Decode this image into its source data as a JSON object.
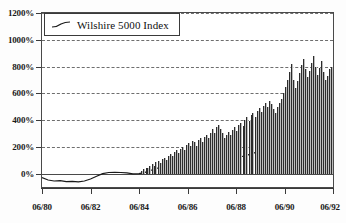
{
  "chart_data": {
    "type": "bar",
    "title": "",
    "xlabel": "",
    "ylabel": "",
    "ylim": [
      -100,
      1200
    ],
    "xlim": [
      "06/80",
      "06/92"
    ],
    "grid": true,
    "legend_position": "top-left",
    "y_ticks": [
      "0%",
      "200%",
      "400%",
      "600%",
      "800%",
      "1000%",
      "1200%"
    ],
    "y_tick_values": [
      0,
      200,
      400,
      600,
      800,
      1000,
      1200
    ],
    "x_ticks": [
      "06/80",
      "06/82",
      "06/84",
      "06/86",
      "06/88",
      "06/90",
      "06/92"
    ],
    "x_tick_values": [
      1980.5,
      1982.5,
      1984.5,
      1986.5,
      1988.5,
      1990.5,
      1992.5
    ],
    "series": [
      {
        "name": "Wilshire 5000 Index",
        "render": "line",
        "color": "#1a1a1a",
        "x": [
          1980.5,
          1980.75,
          1981.0,
          1981.25,
          1981.5,
          1981.75,
          1982.0,
          1982.25,
          1982.5,
          1982.75,
          1983.0,
          1983.25,
          1983.5,
          1983.75,
          1984.0,
          1984.25,
          1984.5,
          1984.75,
          1985.0,
          1985.25,
          1985.5,
          1985.75,
          1986.0,
          1986.25,
          1986.5,
          1986.75,
          1987.0,
          1987.25,
          1987.5,
          1987.75,
          1988.0,
          1988.25,
          1988.5,
          1988.75,
          1989.0,
          1989.25,
          1989.5,
          1989.75,
          1990.0,
          1990.25,
          1990.5,
          1990.75,
          1991.0,
          1991.25,
          1991.5,
          1991.75,
          1992.0,
          1992.25,
          1992.5
        ],
        "values": [
          -30,
          -48,
          -55,
          -52,
          -60,
          -58,
          -62,
          -55,
          -40,
          -20,
          0,
          8,
          10,
          8,
          6,
          -2,
          0,
          10,
          25,
          40,
          55,
          75,
          95,
          110,
          118,
          120,
          135,
          150,
          165,
          120,
          108,
          125,
          130,
          128,
          140,
          155,
          165,
          158,
          150,
          140,
          148,
          170,
          185,
          195,
          200,
          205,
          212,
          218,
          225
        ]
      },
      {
        "name": "monthly bars",
        "render": "bar",
        "color": "#6d6d6d",
        "x": [
          1984.6,
          1984.68,
          1984.77,
          1984.85,
          1984.93,
          1985.02,
          1985.1,
          1985.18,
          1985.27,
          1985.35,
          1985.43,
          1985.52,
          1985.6,
          1985.68,
          1985.77,
          1985.85,
          1985.93,
          1986.02,
          1986.1,
          1986.18,
          1986.27,
          1986.35,
          1986.43,
          1986.52,
          1986.6,
          1986.68,
          1986.77,
          1986.85,
          1986.93,
          1987.02,
          1987.1,
          1987.18,
          1987.27,
          1987.35,
          1987.43,
          1987.52,
          1987.6,
          1987.68,
          1987.77,
          1987.85,
          1987.93,
          1988.02,
          1988.1,
          1988.18,
          1988.27,
          1988.35,
          1988.43,
          1988.52,
          1988.6,
          1988.68,
          1988.77,
          1988.85,
          1988.93,
          1989.02,
          1989.1,
          1989.18,
          1989.27,
          1989.35,
          1989.43,
          1989.52,
          1989.6,
          1989.68,
          1989.77,
          1989.85,
          1989.93,
          1990.02,
          1990.1,
          1990.18,
          1990.27,
          1990.35,
          1990.43,
          1990.52,
          1990.6,
          1990.68,
          1990.77,
          1990.85,
          1990.93,
          1991.02,
          1991.1,
          1991.18,
          1991.27,
          1991.35,
          1991.43,
          1991.52,
          1991.6,
          1991.68,
          1991.77,
          1991.85,
          1991.93,
          1992.02,
          1992.1,
          1992.18,
          1992.27,
          1992.35,
          1992.43
        ],
        "values": [
          20,
          35,
          45,
          40,
          55,
          70,
          60,
          85,
          95,
          80,
          110,
          120,
          105,
          135,
          145,
          130,
          160,
          175,
          155,
          185,
          200,
          180,
          215,
          230,
          205,
          245,
          235,
          210,
          250,
          265,
          240,
          275,
          290,
          270,
          305,
          330,
          300,
          345,
          360,
          330,
          300,
          265,
          290,
          310,
          285,
          325,
          345,
          320,
          360,
          380,
          355,
          400,
          420,
          390,
          435,
          455,
          425,
          470,
          490,
          460,
          505,
          530,
          495,
          545,
          520,
          480,
          455,
          500,
          530,
          560,
          600,
          650,
          700,
          760,
          820,
          700,
          640,
          690,
          750,
          810,
          860,
          780,
          720,
          770,
          830,
          880,
          800,
          740,
          790,
          840,
          760,
          700,
          730,
          780,
          800
        ]
      }
    ]
  },
  "legend": {
    "label": "Wilshire 5000 Index",
    "swatch": "line-swatch-icon"
  }
}
